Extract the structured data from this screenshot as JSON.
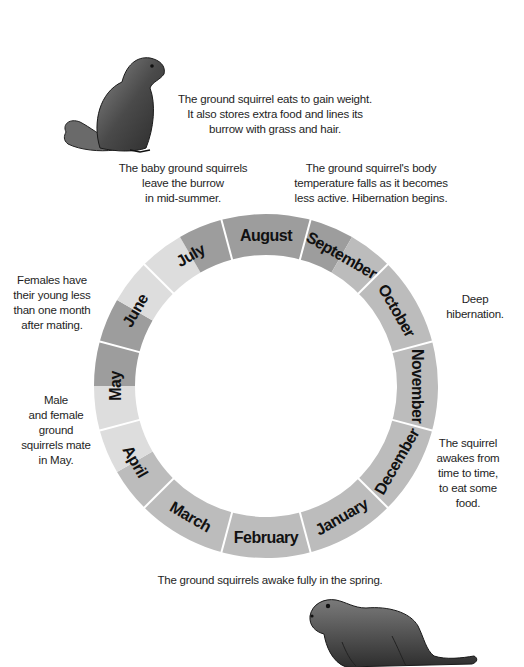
{
  "wheel": {
    "center": [
      266,
      386
    ],
    "outer_radius": 172,
    "inner_radius": 131,
    "label_radius": 151,
    "divider_color": "#ffffff",
    "colors": {
      "dark": "#9d9d9d",
      "medium": "#bcbcbc",
      "light": "#dddddd"
    },
    "months": [
      {
        "name": "August",
        "angle": 0
      },
      {
        "name": "September",
        "angle": 30
      },
      {
        "name": "October",
        "angle": 60
      },
      {
        "name": "November",
        "angle": 90
      },
      {
        "name": "December",
        "angle": 120
      },
      {
        "name": "January",
        "angle": 150
      },
      {
        "name": "February",
        "angle": 180
      },
      {
        "name": "March",
        "angle": 210
      },
      {
        "name": "April",
        "angle": 240
      },
      {
        "name": "May",
        "angle": 270
      },
      {
        "name": "June",
        "angle": 300
      },
      {
        "name": "July",
        "angle": 330
      }
    ],
    "shading": [
      {
        "from": -15,
        "to": 30,
        "tone": "dark"
      },
      {
        "from": 30,
        "to": 225,
        "tone": "medium"
      },
      {
        "from": 225,
        "to": 240,
        "tone": "medium"
      },
      {
        "from": 240,
        "to": 270,
        "tone": "light"
      },
      {
        "from": 270,
        "to": 300,
        "tone": "dark"
      },
      {
        "from": 300,
        "to": 330,
        "tone": "light"
      },
      {
        "from": 330,
        "to": 345,
        "tone": "dark"
      }
    ]
  },
  "notes": {
    "top": [
      "The ground squirrel eats to gain weight.",
      "It also stores extra food and lines its",
      "burrow with grass and hair."
    ],
    "july": [
      "The baby ground squirrels",
      "leave the burrow",
      "in mid-summer."
    ],
    "september": [
      "The ground squirrel's body",
      "temperature falls as it becomes",
      "less active. Hibernation begins."
    ],
    "june": [
      "Females have",
      "their young less",
      "than one month",
      "after mating."
    ],
    "may": [
      "Male",
      "and female",
      "ground",
      "squirrels mate",
      "in May."
    ],
    "november": [
      "Deep",
      "hibernation."
    ],
    "december": [
      "The squirrel",
      "awakes from",
      "time to time,",
      "to eat some",
      "food."
    ],
    "spring": [
      "The ground squirrels awake fully in the spring."
    ]
  },
  "illustrations": {
    "top_squirrel": "sitting-ground-squirrel-illustration",
    "bottom_squirrel": "crouching-ground-squirrel-illustration"
  }
}
